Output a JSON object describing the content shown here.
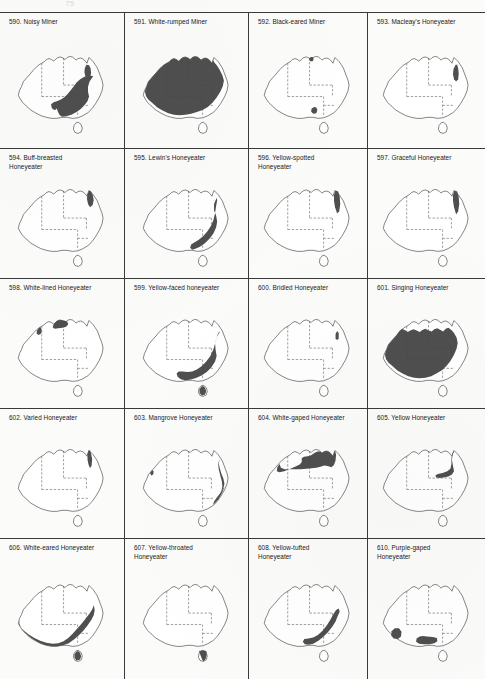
{
  "page": {
    "page_number": "75",
    "columns": 4,
    "rows": 5,
    "ink_color": "#4f4f4f",
    "outline_color": "#2b2b2b",
    "border_color": "#4a4a4a",
    "background_color": "#fbfbfa"
  },
  "map_legend": {
    "shaded_meaning": "distribution range",
    "solid_line": "coastline",
    "dashed_line": "state border"
  },
  "entries": [
    {
      "number": "590.",
      "name": "Noisy Miner",
      "range": "east"
    },
    {
      "number": "591.",
      "name": "White-rumped Miner",
      "range": "most-of-continent"
    },
    {
      "number": "592.",
      "name": "Black-eared Miner",
      "range": "tiny-southeast-spot"
    },
    {
      "number": "593.",
      "name": "Macleay's Honeyeater",
      "range": "ne-qld-coast"
    },
    {
      "number": "594.",
      "name": "Buff-breasted\nHoneyeater",
      "range": "cape-york"
    },
    {
      "number": "595.",
      "name": "Lewin's Honeyeater",
      "range": "east-coast-strip"
    },
    {
      "number": "596.",
      "name": "Yellow-spotted\nHoneyeater",
      "range": "ne-qld-coast"
    },
    {
      "number": "597.",
      "name": "Graceful Honeyeater",
      "range": "ne-qld-coast"
    },
    {
      "number": "598.",
      "name": "White-lined Honeyeater",
      "range": "top-end-kimberley"
    },
    {
      "number": "599.",
      "name": "Yellow-faced honeyeater",
      "range": "east-southeast"
    },
    {
      "number": "600.",
      "name": "Bridled Honeyeater",
      "range": "tiny-ne-qld"
    },
    {
      "number": "601.",
      "name": "Singing Honeyeater",
      "range": "most-of-continent-inland"
    },
    {
      "number": "602.",
      "name": "Varied Honeyeater",
      "range": "cape-york-coast"
    },
    {
      "number": "603.",
      "name": "Mangrove Honeyeater",
      "range": "east-coast-thin"
    },
    {
      "number": "604.",
      "name": "White-gaped Honeyeater",
      "range": "northern"
    },
    {
      "number": "605.",
      "name": "Yellow Honeyeater",
      "range": "ne-qld"
    },
    {
      "number": "606.",
      "name": "White-eared Honeyeater",
      "range": "southern-east"
    },
    {
      "number": "607.",
      "name": "Yellow-throated\nHoneyeater",
      "range": "tasmania"
    },
    {
      "number": "608.",
      "name": "Yellow-tufted\nHoneyeater",
      "range": "southeast"
    },
    {
      "number": "610.",
      "name": "Purple-gaped\nHoneyeater",
      "range": "south-sw"
    }
  ]
}
